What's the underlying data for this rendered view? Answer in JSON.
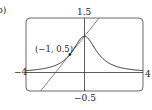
{
  "figure_label": "b)",
  "labels": {
    "ymax": "1.5",
    "ymin": "−0.5",
    "xmin": "−4",
    "xmax": "4",
    "point": "(−1, 0.5)"
  },
  "chart_data": {
    "type": "line",
    "title": "",
    "xlabel": "",
    "ylabel": "",
    "xlim": [
      -4,
      4
    ],
    "ylim": [
      -0.5,
      1.5
    ],
    "grid": false,
    "legend": null,
    "series": [
      {
        "name": "curve y = 1/(1+x^2)",
        "x": [
          -4,
          -3,
          -2,
          -1.5,
          -1,
          -0.5,
          0,
          0.5,
          1,
          1.5,
          2,
          3,
          4
        ],
        "y": [
          0.059,
          0.1,
          0.2,
          0.308,
          0.5,
          0.8,
          1.0,
          0.8,
          0.5,
          0.308,
          0.2,
          0.1,
          0.059
        ]
      },
      {
        "name": "tangent line y = 0.5x + 1",
        "x": [
          -3,
          1
        ],
        "y": [
          -0.5,
          1.5
        ]
      }
    ],
    "annotations": [
      {
        "text": "(−1, 0.5)",
        "x": -1,
        "y": 0.5,
        "marker": "point"
      }
    ]
  }
}
